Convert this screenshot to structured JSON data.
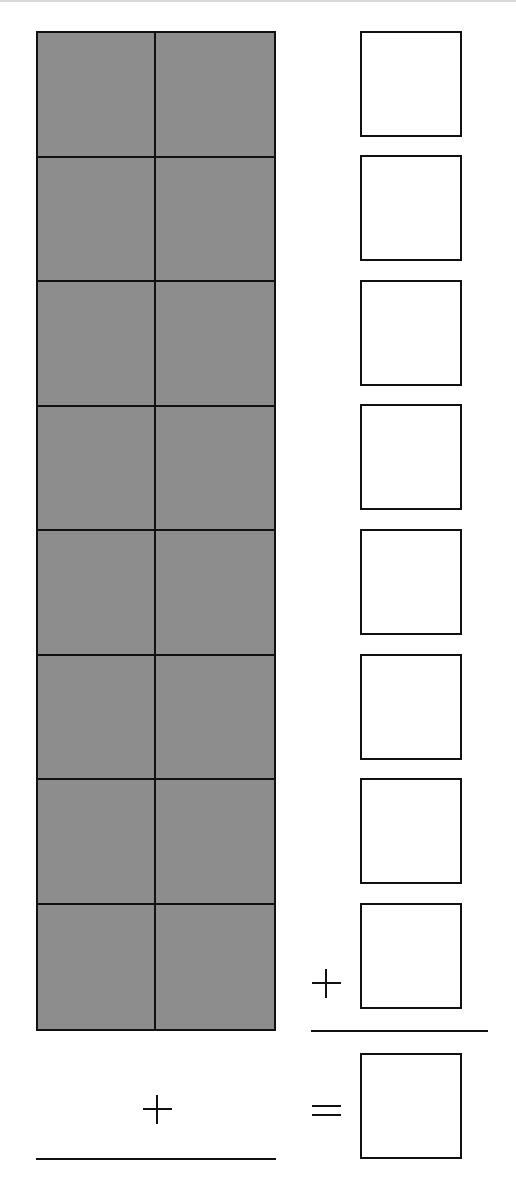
{
  "worksheet": {
    "type": "base-ten model addition",
    "colors": {
      "fill": "#8d8d8d",
      "line": "#111111",
      "background": "#ffffff"
    },
    "grid": {
      "rows": 8,
      "columns": 2,
      "shaded_cells": 16
    },
    "answer_boxes": {
      "count": 8,
      "values": [
        "",
        "",
        "",
        "",
        "",
        "",
        "",
        ""
      ]
    },
    "sum_box": {
      "value": ""
    },
    "symbols": {
      "right_plus": "+",
      "left_plus": "+",
      "equals": "="
    }
  }
}
